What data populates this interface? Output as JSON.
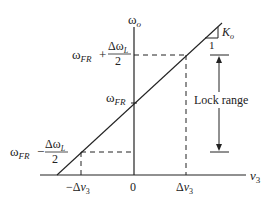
{
  "diagram": {
    "colors": {
      "ink": "#222222",
      "background": "#ffffff"
    },
    "axes": {
      "y_label": "ω",
      "y_label_sub": "o",
      "x_label": "v",
      "x_label_sub": "3",
      "origin_label": "0"
    },
    "y_ticks": {
      "upper": {
        "main": "ω",
        "main_sub": "FR",
        "op": "+",
        "num": "Δω",
        "num_sub": "L",
        "den": "2"
      },
      "center": {
        "main": "ω",
        "main_sub": "FR"
      },
      "lower": {
        "main": "ω",
        "main_sub": "FR",
        "op": "−",
        "num": "Δω",
        "num_sub": "L",
        "den": "2"
      }
    },
    "x_ticks": {
      "neg": {
        "prefix": "−Δ",
        "var": "v",
        "sub": "3"
      },
      "pos": {
        "prefix": "Δ",
        "var": "v",
        "sub": "3"
      }
    },
    "slope": {
      "label": "K",
      "label_sub": "o",
      "run": "1"
    },
    "annotation": {
      "lock_range": "Lock range"
    }
  }
}
